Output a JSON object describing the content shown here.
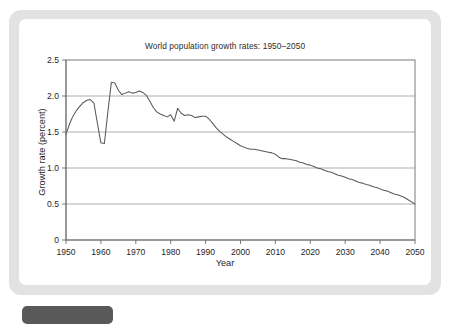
{
  "frame": {
    "bg_color": "#e2e2e2",
    "card_color": "#ffffff",
    "tab_color": "#595959"
  },
  "chart_data": {
    "type": "line",
    "title": "World population growth rates: 1950–2050",
    "xlabel": "Year",
    "ylabel": "Growth rate (percent)",
    "xlim": [
      1950,
      2050
    ],
    "ylim": [
      0,
      2.5
    ],
    "grid": true,
    "grid_axis": "y",
    "legend": "none",
    "line_color": "#5a5a5a",
    "y_ticks": [
      0,
      0.5,
      1.0,
      1.5,
      2.0,
      2.5
    ],
    "y_tick_labels": [
      "0",
      "0.5",
      "1.0",
      "1.5",
      "2.0",
      "2.5"
    ],
    "x_ticks": [
      1950,
      1960,
      1970,
      1980,
      1990,
      2000,
      2010,
      2020,
      2030,
      2040,
      2050
    ],
    "x_tick_labels": [
      "1950",
      "1960",
      "1970",
      "1980",
      "1990",
      "2000",
      "2010",
      "2020",
      "2030",
      "2040",
      "2050"
    ],
    "series": [
      {
        "name": "World population growth rate",
        "x": [
          1950,
          1951,
          1952,
          1953,
          1954,
          1955,
          1956,
          1957,
          1958,
          1959,
          1960,
          1961,
          1962,
          1963,
          1964,
          1965,
          1966,
          1967,
          1968,
          1969,
          1970,
          1971,
          1972,
          1973,
          1974,
          1975,
          1976,
          1977,
          1978,
          1979,
          1980,
          1981,
          1982,
          1983,
          1984,
          1985,
          1986,
          1987,
          1988,
          1989,
          1990,
          1991,
          1992,
          1993,
          1994,
          1995,
          1996,
          1997,
          1998,
          1999,
          2000,
          2001,
          2002,
          2003,
          2004,
          2005,
          2006,
          2007,
          2008,
          2009,
          2010,
          2011,
          2012,
          2013,
          2014,
          2015,
          2016,
          2017,
          2018,
          2019,
          2020,
          2021,
          2022,
          2023,
          2024,
          2025,
          2026,
          2027,
          2028,
          2029,
          2030,
          2031,
          2032,
          2033,
          2034,
          2035,
          2036,
          2037,
          2038,
          2039,
          2040,
          2041,
          2042,
          2043,
          2044,
          2045,
          2046,
          2047,
          2048,
          2049,
          2050
        ],
        "values": [
          1.47,
          1.61,
          1.72,
          1.8,
          1.86,
          1.91,
          1.94,
          1.95,
          1.9,
          1.62,
          1.35,
          1.34,
          1.78,
          2.19,
          2.18,
          2.08,
          2.02,
          2.04,
          2.06,
          2.04,
          2.05,
          2.07,
          2.05,
          2.01,
          1.93,
          1.84,
          1.78,
          1.75,
          1.73,
          1.71,
          1.74,
          1.65,
          1.83,
          1.76,
          1.73,
          1.74,
          1.73,
          1.7,
          1.71,
          1.72,
          1.72,
          1.68,
          1.62,
          1.56,
          1.51,
          1.47,
          1.43,
          1.4,
          1.37,
          1.34,
          1.31,
          1.29,
          1.27,
          1.26,
          1.26,
          1.25,
          1.24,
          1.23,
          1.22,
          1.21,
          1.19,
          1.15,
          1.13,
          1.13,
          1.12,
          1.11,
          1.1,
          1.08,
          1.07,
          1.05,
          1.04,
          1.02,
          1.0,
          0.99,
          0.97,
          0.95,
          0.94,
          0.92,
          0.9,
          0.89,
          0.87,
          0.85,
          0.84,
          0.82,
          0.8,
          0.79,
          0.77,
          0.76,
          0.74,
          0.73,
          0.71,
          0.69,
          0.68,
          0.66,
          0.64,
          0.63,
          0.61,
          0.59,
          0.56,
          0.53,
          0.5
        ]
      }
    ]
  }
}
